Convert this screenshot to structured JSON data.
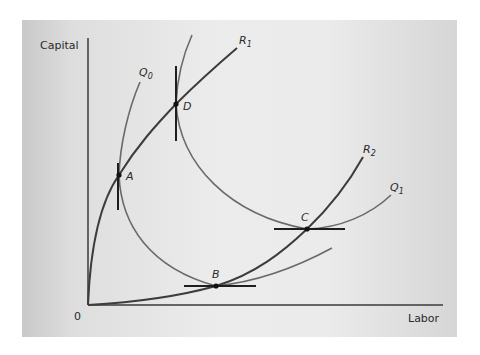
{
  "figure": {
    "axes": {
      "y_label": "Capital",
      "x_label": "Labor",
      "origin_label": "0"
    },
    "curves": {
      "expansion_paths": [
        {
          "id": "R1",
          "label": "R",
          "subscript": "1"
        },
        {
          "id": "R2",
          "label": "R",
          "subscript": "2"
        }
      ],
      "isoquants": [
        {
          "id": "Q0",
          "label": "Q",
          "subscript": "0"
        },
        {
          "id": "Q1",
          "label": "Q",
          "subscript": "1"
        }
      ]
    },
    "points": [
      {
        "id": "A",
        "label": "A",
        "tangent": "vertical",
        "on": [
          "R1",
          "Q0"
        ]
      },
      {
        "id": "B",
        "label": "B",
        "tangent": "horizontal",
        "on": [
          "R2",
          "Q0"
        ]
      },
      {
        "id": "C",
        "label": "C",
        "tangent": "horizontal",
        "on": [
          "R2",
          "Q1"
        ]
      },
      {
        "id": "D",
        "label": "D",
        "tangent": "vertical",
        "on": [
          "R1",
          "Q1"
        ]
      }
    ],
    "colors": {
      "panel_bg": "#e6e6e6",
      "axis": "#3a3a3a",
      "ridge_line": "#3c3c3c",
      "isoquant": "#6a6a6a",
      "tangent": "#1e1e1e",
      "point": "#111111"
    }
  }
}
